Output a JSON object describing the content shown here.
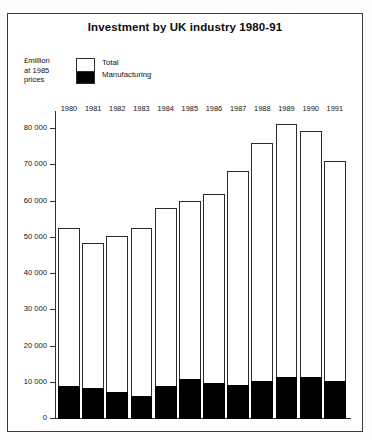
{
  "figure": {
    "title": "Investment by UK industry 1980-91",
    "y_axis_caption": "£million\nat 1985\nprices",
    "legend": {
      "total_label": "Total",
      "manufacturing_label": "Manufacturing",
      "total_color": "#ffffff",
      "manufacturing_color": "#000000"
    },
    "border_color": "#3a3a3a",
    "axis_color": "#2f2f2f"
  },
  "chart_data": {
    "type": "bar",
    "title": "Investment by UK industry 1980-91",
    "subtitle": "",
    "xlabel": "",
    "ylabel": "£million at 1985 prices",
    "ylim": [
      0,
      85000
    ],
    "grid": false,
    "legend_position": "top-left",
    "stacked": true,
    "categories": [
      "1980",
      "1981",
      "1982",
      "1983",
      "1984",
      "1985",
      "1986",
      "1987",
      "1988",
      "1989",
      "1990",
      "1991"
    ],
    "ytick_values": [
      0,
      10000,
      20000,
      30000,
      40000,
      50000,
      60000,
      70000,
      80000
    ],
    "ytick_labels": [
      "0",
      "10 000",
      "20 000",
      "30 000",
      "40 000",
      "50 000",
      "60 000",
      "70 000",
      "80 000"
    ],
    "series": [
      {
        "name": "Total",
        "values": [
          52800,
          48500,
          50400,
          52800,
          58200,
          60300,
          62100,
          68400,
          76200,
          81500,
          79500,
          71300
        ]
      },
      {
        "name": "Manufacturing",
        "values": [
          8900,
          8200,
          7200,
          6200,
          8900,
          10800,
          9600,
          9200,
          10100,
          11200,
          11200,
          10100
        ]
      }
    ]
  }
}
